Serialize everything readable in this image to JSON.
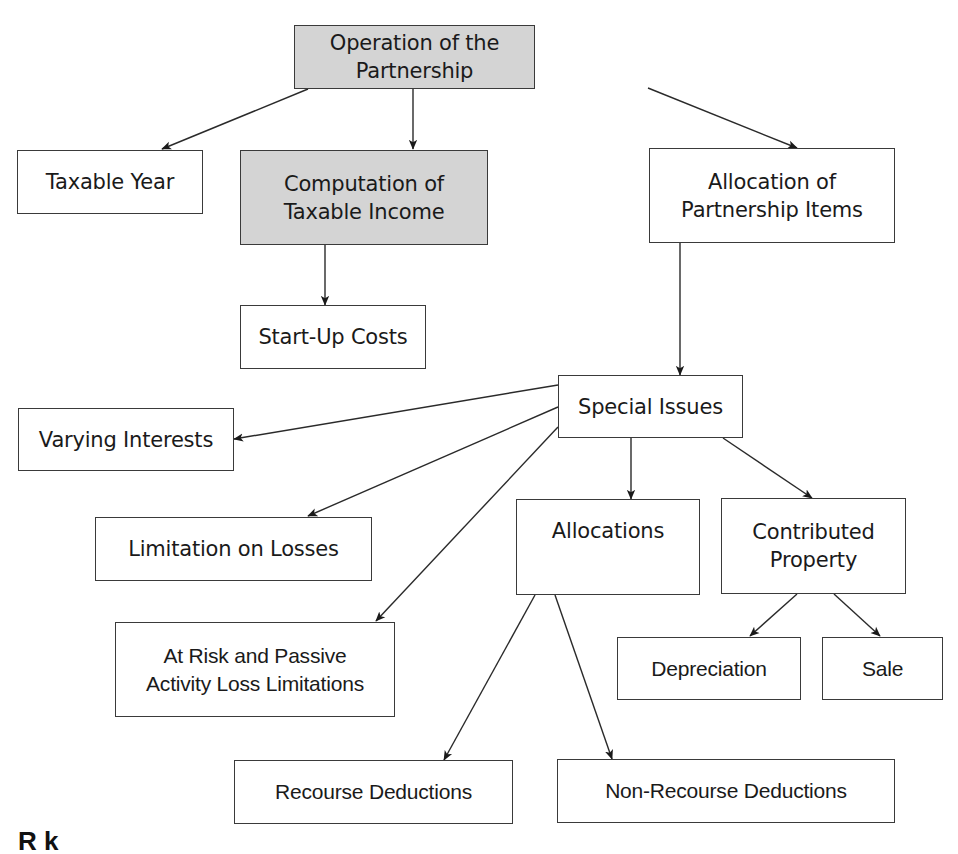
{
  "diagram": {
    "title": "Operation of the Partnership",
    "nodes": [
      {
        "id": "operation",
        "label": "Operation of the Partnership",
        "shaded": true
      },
      {
        "id": "taxable-year",
        "label": "Taxable Year",
        "shaded": false
      },
      {
        "id": "computation",
        "label": "Computation of\nTaxable Income",
        "shaded": true
      },
      {
        "id": "allocation-items",
        "label": "Allocation of\nPartnership Items",
        "shaded": false
      },
      {
        "id": "start-up",
        "label": "Start-Up Costs",
        "shaded": false
      },
      {
        "id": "special-issues",
        "label": "Special Issues",
        "shaded": false
      },
      {
        "id": "varying-interests",
        "label": "Varying Interests",
        "shaded": false
      },
      {
        "id": "limitation-losses",
        "label": "Limitation on Losses",
        "shaded": false
      },
      {
        "id": "allocations",
        "label": "Allocations",
        "shaded": false
      },
      {
        "id": "contributed-property",
        "label": "Contributed\nProperty",
        "shaded": false
      },
      {
        "id": "at-risk",
        "label": "At Risk and Passive\nActivity Loss Limitations",
        "shaded": false
      },
      {
        "id": "depreciation",
        "label": "Depreciation",
        "shaded": false
      },
      {
        "id": "sale",
        "label": "Sale",
        "shaded": false
      },
      {
        "id": "recourse",
        "label": "Recourse Deductions",
        "shaded": false
      },
      {
        "id": "non-recourse",
        "label": "Non-Recourse Deductions",
        "shaded": false
      }
    ],
    "edges": [
      [
        "operation",
        "taxable-year"
      ],
      [
        "operation",
        "computation"
      ],
      [
        "operation",
        "allocation-items"
      ],
      [
        "computation",
        "start-up"
      ],
      [
        "allocation-items",
        "special-issues"
      ],
      [
        "special-issues",
        "varying-interests"
      ],
      [
        "special-issues",
        "limitation-losses"
      ],
      [
        "special-issues",
        "at-risk"
      ],
      [
        "special-issues",
        "allocations"
      ],
      [
        "special-issues",
        "contributed-property"
      ],
      [
        "allocations",
        "recourse"
      ],
      [
        "allocations",
        "non-recourse"
      ],
      [
        "contributed-property",
        "depreciation"
      ],
      [
        "contributed-property",
        "sale"
      ]
    ],
    "colors": {
      "shaded_fill": "#d4d4d4",
      "border": "#3a3a3a",
      "line": "#2a2a2a"
    },
    "footer_fragment": "R    k"
  }
}
